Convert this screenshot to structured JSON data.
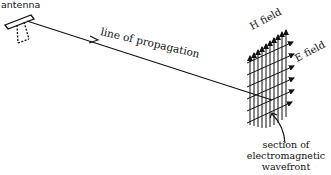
{
  "diagram": {
    "labels": {
      "antenna": "antenna",
      "line": "line of propagation",
      "h_field": "H field",
      "e_field": "E field",
      "caption_line1": "section of",
      "caption_line2": "electromagnetic",
      "caption_line3": "wavefront"
    },
    "colors": {
      "ink": "#111111",
      "background": "#ffffff"
    }
  }
}
